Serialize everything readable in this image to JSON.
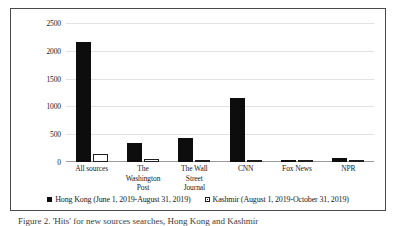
{
  "figure": {
    "caption": "Figure 2. 'Hits' for new sources searches, Hong Kong and Kashmir"
  },
  "chart_data": {
    "type": "bar",
    "title": "",
    "xlabel": "",
    "ylabel": "Number of 'hits'",
    "ylim": [
      0,
      2500
    ],
    "yticks": [
      "0",
      "500",
      "1000",
      "1500",
      "2000",
      "2500"
    ],
    "ytick_values": [
      0,
      500,
      1000,
      1500,
      2000,
      2500
    ],
    "grid": true,
    "legend_position": "bottom",
    "categories": [
      "All sources",
      "The Washington Post",
      "The Wall Street Journal",
      "CNN",
      "Fox News",
      "NPR"
    ],
    "category_lines": [
      [
        "All sources"
      ],
      [
        "The",
        "Washington",
        "Post"
      ],
      [
        "The Wall",
        "Street",
        "Journal"
      ],
      [
        "CNN"
      ],
      [
        "Fox News"
      ],
      [
        "NPR"
      ]
    ],
    "series": [
      {
        "name": "Hong Kong (June 1, 2019-August 31, 2019)",
        "key": "hong-kong",
        "color": "#0d0d0d",
        "values": [
          2150,
          350,
          440,
          1150,
          30,
          80
        ]
      },
      {
        "name": "Kashmir (August 1, 2019-October 31, 2019)",
        "key": "kashmir",
        "color": "#ffffff",
        "values": [
          150,
          60,
          15,
          45,
          8,
          12
        ]
      }
    ]
  }
}
